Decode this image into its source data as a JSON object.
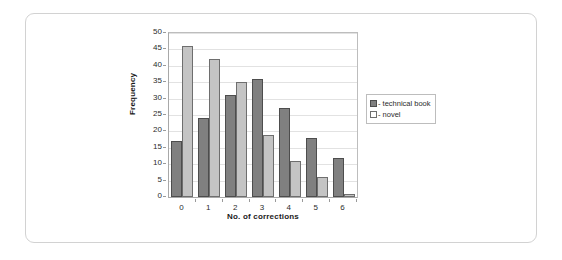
{
  "figure": {
    "frame_border_color": "#d2d2d2",
    "background": "#ffffff"
  },
  "chart_data": {
    "type": "bar",
    "title": "",
    "subtitle": "",
    "xlabel": "No. of corrections",
    "ylabel": "Frequency",
    "categories": [
      "0",
      "1",
      "2",
      "3",
      "4",
      "5",
      "6"
    ],
    "series": [
      {
        "name": "- technical book",
        "color": "#808080",
        "values": [
          17,
          24,
          31,
          36,
          27,
          18,
          12
        ]
      },
      {
        "name": "- novel",
        "color": "#c4c4c4",
        "values": [
          46,
          42,
          35,
          19,
          11,
          6,
          1
        ]
      }
    ],
    "ylim": [
      0,
      50
    ],
    "ytick_step": 5,
    "yticks": [
      "0",
      "5",
      "10",
      "15",
      "20",
      "25",
      "30",
      "35",
      "40",
      "45",
      "50"
    ],
    "grid": "horizontal",
    "legend_position": "right"
  },
  "legend": {
    "entries": [
      {
        "label": "- technical book"
      },
      {
        "label": "- novel"
      }
    ]
  }
}
